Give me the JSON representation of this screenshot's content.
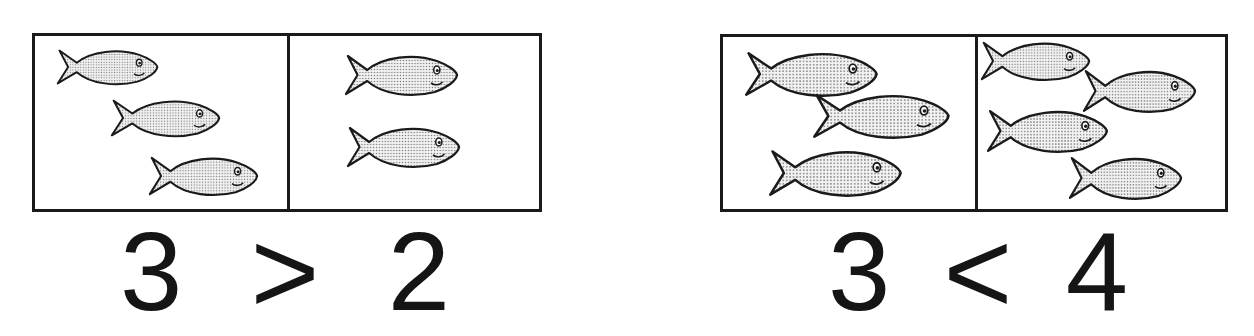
{
  "comparisons": [
    {
      "left_count": 3,
      "right_count": 2,
      "expression": {
        "left": "3",
        "symbol": ">",
        "right": "2"
      },
      "left_fish": [
        {
          "x": 56,
          "y": 48,
          "w": 104,
          "h": 38
        },
        {
          "x": 110,
          "y": 98,
          "w": 112,
          "h": 40
        },
        {
          "x": 148,
          "y": 155,
          "w": 112,
          "h": 42
        }
      ],
      "right_fish": [
        {
          "x": 344,
          "y": 53,
          "w": 116,
          "h": 44
        },
        {
          "x": 346,
          "y": 125,
          "w": 116,
          "h": 44
        }
      ]
    },
    {
      "left_count": 3,
      "right_count": 4,
      "expression": {
        "left": "3",
        "symbol": "<",
        "right": "4"
      },
      "left_fish": [
        {
          "x": 744,
          "y": 50,
          "w": 136,
          "h": 48
        },
        {
          "x": 812,
          "y": 92,
          "w": 140,
          "h": 48
        },
        {
          "x": 768,
          "y": 148,
          "w": 136,
          "h": 50
        }
      ],
      "right_fish": [
        {
          "x": 980,
          "y": 40,
          "w": 112,
          "h": 42
        },
        {
          "x": 1082,
          "y": 68,
          "w": 116,
          "h": 46
        },
        {
          "x": 986,
          "y": 108,
          "w": 124,
          "h": 46
        },
        {
          "x": 1068,
          "y": 155,
          "w": 116,
          "h": 46
        }
      ]
    }
  ],
  "colors": {
    "outline": "#1a1a1a",
    "fill": "#d9d9d9",
    "background": "#ffffff"
  }
}
